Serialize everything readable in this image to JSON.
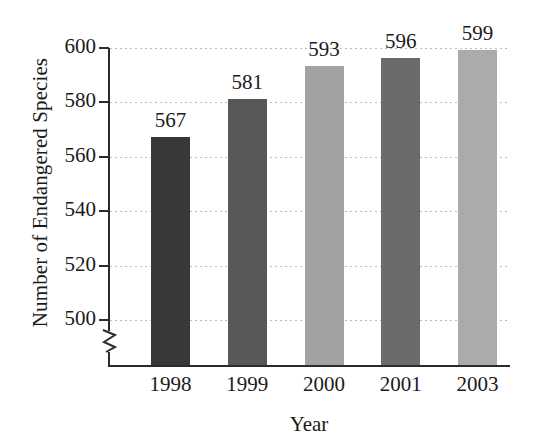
{
  "chart_data": {
    "type": "bar",
    "title": "",
    "xlabel": "Year",
    "ylabel": "Number of Endangered Species",
    "categories": [
      "1998",
      "1999",
      "2000",
      "2001",
      "2003"
    ],
    "values": [
      567,
      581,
      593,
      596,
      599
    ],
    "value_labels": [
      "567",
      "581",
      "593",
      "596",
      "599"
    ],
    "bar_colors": [
      "#383838",
      "#585858",
      "#a2a2a2",
      "#6b6b6b",
      "#ababab"
    ],
    "ylim": [
      492,
      604
    ],
    "y_axis_break": true,
    "y_ticks": [
      500,
      520,
      540,
      560,
      580,
      600
    ],
    "y_tick_labels": [
      "500",
      "520",
      "540",
      "560",
      "580",
      "600"
    ],
    "grid": "horizontal-dotted",
    "legend": "none",
    "background_color": "#ffffff",
    "axis_color": "#2b2b2b",
    "gridline_color": "#bdbdbd"
  }
}
